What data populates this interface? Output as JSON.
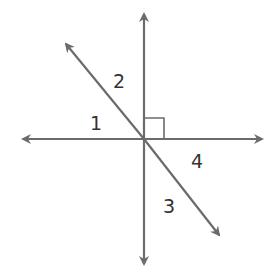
{
  "diagram": {
    "type": "intersecting-lines",
    "line_color": "#6b6b6b",
    "label_color": "#333333",
    "angle_labels": [
      "1",
      "2",
      "3",
      "4"
    ],
    "right_angle_marker": true
  }
}
